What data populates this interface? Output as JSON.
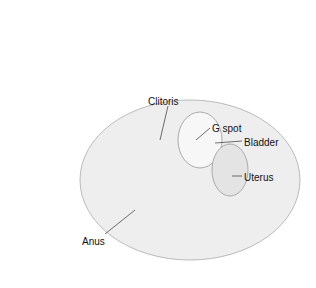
{
  "diagram": {
    "type": "labeled anatomical illustration (abstracted)",
    "labels": [
      {
        "id": "clitoris",
        "text": "Clitoris",
        "x": 148,
        "y": 96
      },
      {
        "id": "g-spot",
        "text": "G spot",
        "x": 212,
        "y": 123
      },
      {
        "id": "bladder",
        "text": "Bladder",
        "x": 244,
        "y": 137
      },
      {
        "id": "uterus",
        "text": "Uterus",
        "x": 244,
        "y": 172
      },
      {
        "id": "anus",
        "text": "Anus",
        "x": 82,
        "y": 236
      }
    ]
  }
}
